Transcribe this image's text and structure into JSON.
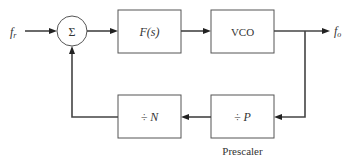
{
  "diagram": {
    "input": {
      "label_main": "f",
      "label_sub": "r"
    },
    "output": {
      "label_main": "f",
      "label_sub": "o"
    },
    "summer": {
      "symbol": "Σ"
    },
    "blocks": {
      "filter": {
        "label": "F(s)"
      },
      "vco": {
        "label": "VCO"
      },
      "divider_n": {
        "label": "÷ N"
      },
      "divider_p": {
        "label": "÷ P",
        "caption": "Prescaler"
      }
    },
    "colors": {
      "stroke": "#444444",
      "text": "#333333",
      "background": "#ffffff"
    }
  }
}
